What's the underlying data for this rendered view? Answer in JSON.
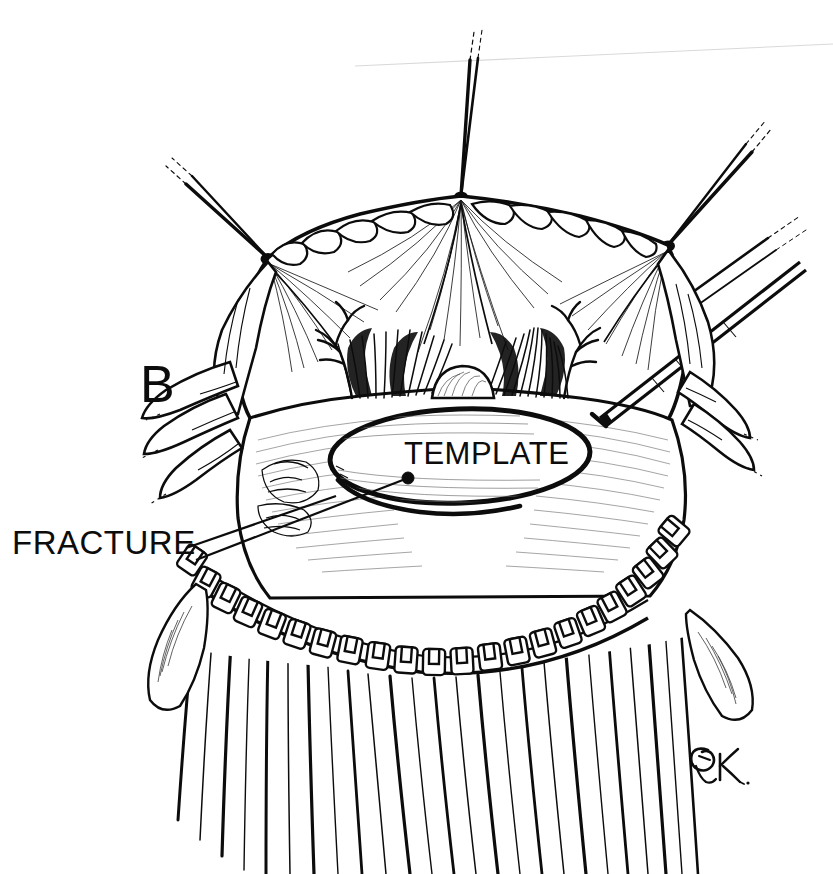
{
  "figure": {
    "panel_letter": "B",
    "width": 833,
    "height": 874,
    "background_color": "#ffffff",
    "ink_color": "#0c0c0c",
    "medium": "pen-and-ink line drawing"
  },
  "labels": {
    "fracture": "FRACTURE",
    "template": "TEMPLATE"
  },
  "annotations": {
    "fracture_leader": {
      "from_x": 186,
      "from_y": 548,
      "to_x": 330,
      "to_y": 498
    },
    "template_leader": {
      "from_x": 408,
      "from_y": 478,
      "to_x": 196,
      "to_y": 560,
      "dot_x": 408,
      "dot_y": 478,
      "dot_r": 6
    }
  },
  "signature": {
    "artist_monogram": "ER",
    "x": 686,
    "y": 736
  },
  "sutures": [
    {
      "name": "left-suture-knot",
      "x": 268,
      "y": 258
    },
    {
      "name": "center-suture-knot",
      "x": 461,
      "y": 196
    },
    {
      "name": "right-suture-knot",
      "x": 668,
      "y": 245
    }
  ],
  "instrument": {
    "name": "marking-probe",
    "tip_x": 600,
    "tip_y": 418,
    "shaft_angle_deg": -42
  },
  "template_oval": {
    "cx": 460,
    "cy": 456,
    "rx": 132,
    "ry": 49,
    "rotation_deg": -2
  },
  "clip_row": {
    "name": "surgical-clip-row",
    "count": 22,
    "start_x": 188,
    "end_x": 648,
    "arc_bottom_y": 660
  }
}
